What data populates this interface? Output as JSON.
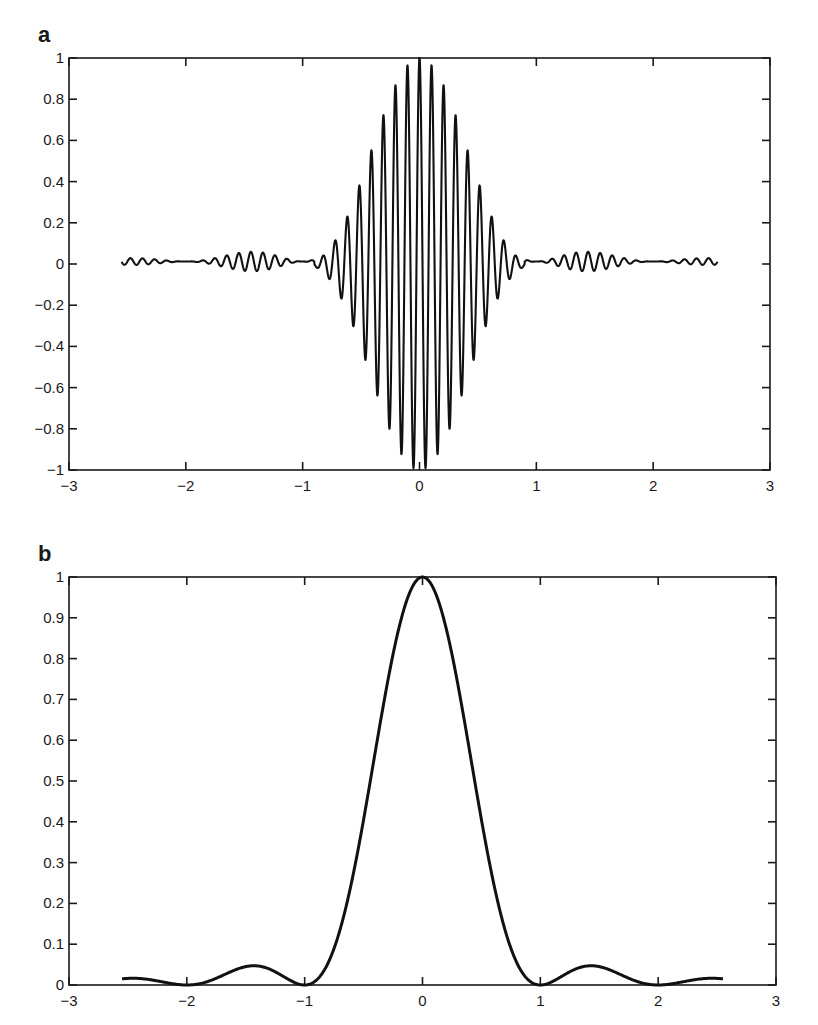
{
  "chart_data": [
    {
      "panel": "a",
      "type": "line",
      "title": "",
      "panel_label": "a",
      "xlabel": "",
      "ylabel": "",
      "xlim": [
        -3,
        3
      ],
      "ylim": [
        -1,
        1
      ],
      "grid": false,
      "legend": null,
      "xticks": [
        -3,
        -2,
        -1,
        0,
        1,
        2,
        3
      ],
      "xtick_labels": [
        "−3",
        "−2",
        "−1",
        "0",
        "1",
        "2",
        "3"
      ],
      "yticks": [
        -1,
        -0.8,
        -0.6,
        -0.4,
        -0.2,
        0,
        0.2,
        0.4,
        0.6,
        0.8,
        1
      ],
      "ytick_labels": [
        "−1",
        "−0.8",
        "−0.6",
        "−0.4",
        "−0.2",
        "0",
        "0.2",
        "0.4",
        "0.6",
        "0.8",
        "1"
      ],
      "description": "Modulated oscillation: sinc^2 envelope times carrier of ~9.7 cycles per unit, x from -2.55 to 2.55",
      "model": {
        "envelope": "sinc2",
        "carrier_freq": 9.7,
        "x_start": -2.55,
        "x_end": 2.55,
        "samples": 2400,
        "offset": 0.012
      },
      "series": [
        {
          "name": "signal",
          "x": [
            -2.5,
            -2.0,
            -1.5,
            -1.43,
            -1.0,
            -0.5,
            -0.3,
            -0.1,
            0,
            0.1,
            0.3,
            0.5,
            1.0,
            1.43,
            1.5,
            2.0,
            2.5
          ],
          "envelope_values": [
            0.016,
            0.0,
            0.045,
            0.047,
            0.0,
            0.405,
            0.74,
            0.97,
            1.0,
            0.97,
            0.74,
            0.405,
            0.0,
            0.047,
            0.045,
            0.0,
            0.016
          ]
        }
      ]
    },
    {
      "panel": "b",
      "type": "line",
      "title": "",
      "panel_label": "b",
      "xlabel": "",
      "ylabel": "",
      "xlim": [
        -3,
        3
      ],
      "ylim": [
        0,
        1
      ],
      "grid": false,
      "legend": null,
      "xticks": [
        -3,
        -2,
        -1,
        0,
        1,
        2,
        3
      ],
      "xtick_labels": [
        "−3",
        "−2",
        "−1",
        "0",
        "1",
        "2",
        "3"
      ],
      "yticks": [
        0,
        0.1,
        0.2,
        0.3,
        0.4,
        0.5,
        0.6,
        0.7,
        0.8,
        0.9,
        1
      ],
      "ytick_labels": [
        "0",
        "0.1",
        "0.2",
        "0.3",
        "0.4",
        "0.5",
        "0.6",
        "0.7",
        "0.8",
        "0.9",
        "1"
      ],
      "description": "Envelope curve sinc^2(x): main lobe peak 1 at x=0, zeros at ±1 and ±2, sidelobes ~0.045 at ±1.43",
      "model": {
        "envelope": "sinc2",
        "x_start": -2.55,
        "x_end": 2.55,
        "samples": 600
      },
      "series": [
        {
          "name": "envelope",
          "x": [
            -2.55,
            -2.0,
            -1.43,
            -1.0,
            -0.66,
            -0.5,
            -0.26,
            0,
            0.26,
            0.5,
            0.66,
            1.0,
            1.43,
            2.0,
            2.55
          ],
          "y": [
            0.016,
            0.0,
            0.047,
            0.0,
            0.18,
            0.405,
            0.8,
            1.0,
            0.8,
            0.405,
            0.18,
            0.0,
            0.047,
            0.0,
            0.016
          ]
        }
      ]
    }
  ]
}
